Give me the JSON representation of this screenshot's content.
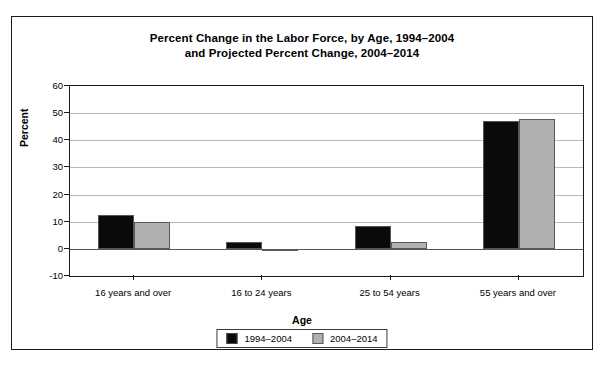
{
  "chart_data": {
    "type": "bar",
    "title": "Percent Change in the Labor Force, by Age, 1994–2004 and Projected Percent Change, 2004–2014",
    "title_lines": [
      "Percent Change in the Labor Force, by Age, 1994–2004",
      "and Projected Percent Change, 2004–2014"
    ],
    "xlabel": "Age",
    "ylabel": "Percent",
    "categories": [
      "16 years and over",
      "16 to 24 years",
      "25 to 54 years",
      "55 years and over"
    ],
    "series": [
      {
        "name": "1994–2004",
        "color": "#0a0a0a",
        "values": [
          12.5,
          2.5,
          8.5,
          47.0
        ]
      },
      {
        "name": "2004–2014",
        "color": "#b0b0b0",
        "values": [
          10.0,
          -0.5,
          2.5,
          48.0
        ]
      }
    ],
    "ylim": [
      -10,
      60
    ],
    "yticks": [
      60,
      50,
      40,
      30,
      20,
      10,
      0,
      -10
    ],
    "ytick_labels": [
      "60",
      "50",
      "40",
      "30",
      "20",
      "10",
      "0",
      "-10"
    ],
    "grid": true,
    "legend_position": "bottom-center"
  }
}
